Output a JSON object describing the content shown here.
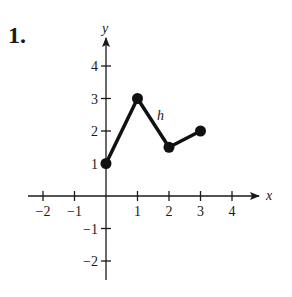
{
  "problem": {
    "number": "1."
  },
  "graph": {
    "x_axis_label": "x",
    "y_axis_label": "y",
    "function_label": "h",
    "x_ticks": [
      {
        "value": -2,
        "label": "−2"
      },
      {
        "value": -1,
        "label": "−1"
      },
      {
        "value": 1,
        "label": "1"
      },
      {
        "value": 2,
        "label": "2"
      },
      {
        "value": 3,
        "label": "3"
      },
      {
        "value": 4,
        "label": "4"
      }
    ],
    "y_ticks": [
      {
        "value": -2,
        "label": "−2"
      },
      {
        "value": -1,
        "label": "−1"
      },
      {
        "value": 1,
        "label": "1"
      },
      {
        "value": 2,
        "label": "2"
      },
      {
        "value": 3,
        "label": "3"
      },
      {
        "value": 4,
        "label": "4"
      }
    ],
    "points": [
      {
        "x": 0,
        "y": 1
      },
      {
        "x": 1,
        "y": 3
      },
      {
        "x": 2,
        "y": 1.5
      },
      {
        "x": 3,
        "y": 2
      }
    ]
  },
  "chart_data": {
    "type": "line",
    "title": "",
    "xlabel": "x",
    "ylabel": "y",
    "series": [
      {
        "name": "h",
        "x": [
          0,
          1,
          2,
          3
        ],
        "values": [
          1,
          3,
          1.5,
          2
        ]
      }
    ],
    "xlim": [
      -2.5,
      4.8
    ],
    "ylim": [
      -2.5,
      4.8
    ],
    "grid": false,
    "endpoints": "closed dots at all four vertices"
  }
}
